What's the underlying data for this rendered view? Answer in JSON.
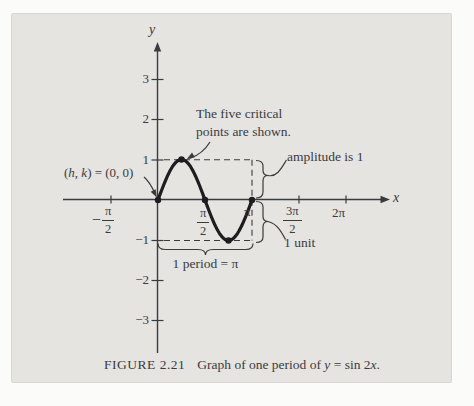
{
  "colors": {
    "panel_bg": "#e5e4e1",
    "ink": "#3b3b3d",
    "curve": "#1d1d1f"
  },
  "axes": {
    "x_label": "x",
    "y_label": "y"
  },
  "y_ticks": [
    {
      "label": "3"
    },
    {
      "label": "2"
    },
    {
      "label": "1"
    },
    {
      "label": "−1"
    },
    {
      "label": "−2"
    },
    {
      "label": "−3"
    }
  ],
  "x_ticks": {
    "neg_half_pi": {
      "sign": "−",
      "num": "π",
      "den": "2"
    },
    "half_pi": {
      "num": "π",
      "den": "2"
    },
    "pi": {
      "label": "π"
    },
    "three_half_pi": {
      "num": "3π",
      "den": "2"
    },
    "two_pi": {
      "label": "2π"
    }
  },
  "annotations": {
    "critical_note_line1": "The five critical",
    "critical_note_line2": "points are shown.",
    "amplitude_label": "amplitude is 1",
    "unit_label": "1 unit",
    "period_label": "1 period = π",
    "hk_open": "(",
    "hk_h": "h",
    "hk_comma": ", ",
    "hk_k": "k",
    "hk_rest": ") = (0, 0)"
  },
  "caption": {
    "figure_label": "FIGURE 2.21",
    "text_prefix": "Graph of one period of ",
    "var_y": "y",
    "text_mid": " = sin 2",
    "var_x": "x",
    "text_suffix": "."
  },
  "chart_data": {
    "type": "line",
    "function": "y = sin(2x)",
    "amplitude": 1,
    "period": 3.14159,
    "center_hk": [
      0,
      0
    ],
    "x_range_shown": [
      -1.5708,
      6.9
    ],
    "y_range_shown": [
      -3.6,
      3.6
    ],
    "x_tick_labels": [
      "-π/2",
      "π/2",
      "π",
      "3π/2",
      "2π"
    ],
    "x_tick_values": [
      -1.5708,
      1.5708,
      3.14159,
      4.71239,
      6.28319
    ],
    "y_tick_values": [
      -3,
      -2,
      -1,
      1,
      2,
      3
    ],
    "grid": false,
    "legend": "none",
    "series": [
      {
        "name": "y = sin 2x",
        "x_start": 0,
        "x_end": 3.14159
      }
    ],
    "critical_points": [
      {
        "x": 0.0,
        "y": 0
      },
      {
        "x": 0.7854,
        "y": 1
      },
      {
        "x": 1.5708,
        "y": 0
      },
      {
        "x": 2.3562,
        "y": -1
      },
      {
        "x": 3.14159,
        "y": 0
      }
    ]
  }
}
